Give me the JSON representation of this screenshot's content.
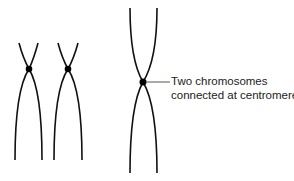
{
  "diagram": {
    "annotation": {
      "line1": "Two chromosomes",
      "line2": "connected at centromere"
    },
    "colors": {
      "stroke": "#111111",
      "text": "#222222",
      "background": "#ffffff"
    }
  }
}
